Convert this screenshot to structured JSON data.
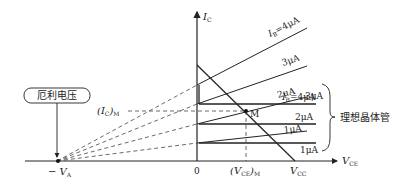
{
  "diagram": {
    "title": "",
    "axes": {
      "y_label_main": "I",
      "y_label_sub": "C",
      "x_label_main": "V",
      "x_label_sub": "CE",
      "origin_label": "0",
      "early_voltage_label_prefix": "− V",
      "early_voltage_label_sub": "A"
    },
    "callout": {
      "early_voltage_box": "厄利电压",
      "ideal_transistor": "理想晶体管"
    },
    "q_point": {
      "label": "M",
      "ic_label_main": "(I",
      "ic_label_sub": "C",
      "ic_label_tail": ")",
      "ic_label_tail_sub": "M",
      "vce_label_main": "(V",
      "vce_label_sub": "CE",
      "vce_label_tail": ")",
      "vce_label_tail_sub": "M"
    },
    "load_line": {
      "end_label_main": "V",
      "end_label_sub": "CC"
    },
    "real_curves": [
      {
        "label_prefix": "I",
        "label_sub": "B",
        "label_value": "=4μA"
      },
      {
        "label_value": "3μA"
      },
      {
        "label_value": "2μA"
      },
      {
        "label_value": "1μA"
      }
    ],
    "ideal_curves": [
      {
        "label_prefix": "I",
        "label_sub": "B",
        "label_value": "=4μA"
      },
      {
        "label_value": "3μA"
      },
      {
        "label_value": "2μA"
      },
      {
        "label_value": "1μA"
      }
    ]
  }
}
